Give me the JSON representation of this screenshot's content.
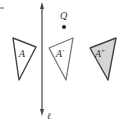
{
  "diagram": {
    "line": {
      "label": "ℓ",
      "x": 42,
      "y1": 3,
      "y2": 115,
      "color": "#444444"
    },
    "point": {
      "label": "Q",
      "x": 64,
      "y": 27,
      "color": "#222222"
    },
    "triangles": [
      {
        "label": "A",
        "points": "13,38 36,47 19,80",
        "fill": "#ffffff",
        "stroke": "#444444",
        "label_x": 19,
        "label_y": 57
      },
      {
        "label": "A′",
        "points": "49,48 73,38 66,80",
        "fill": "#ffffff",
        "stroke": "#666666",
        "label_x": 56,
        "label_y": 57
      },
      {
        "label": "A″",
        "points": "90,48 116,38 108,80",
        "fill": "#d6d6d6",
        "stroke": "#444444",
        "label_x": 95,
        "label_y": 57
      }
    ],
    "corner_mark": {
      "x1": 0,
      "y1": 8,
      "x2": 4,
      "y2": 8
    }
  }
}
